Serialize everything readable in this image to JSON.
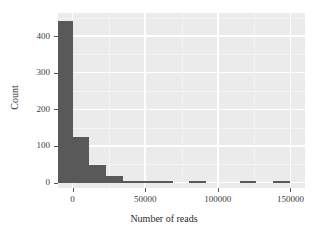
{
  "chart": {
    "title": "",
    "background": "#ffffff",
    "panel_background": "#ebebeb",
    "grid_color": "#ffffff",
    "bar_color": "#595959",
    "axis_text_color": "#3b3b3b"
  },
  "axes": {
    "x": {
      "label": "Number of reads",
      "ticks": [
        {
          "value": 0,
          "label": "0"
        },
        {
          "value": 50000,
          "label": "50000"
        },
        {
          "value": 100000,
          "label": "100000"
        },
        {
          "value": 150000,
          "label": "150000"
        }
      ],
      "minor_ticks": [
        25000,
        75000,
        125000
      ],
      "range": [
        -10000,
        160000
      ]
    },
    "y": {
      "label": "Count",
      "ticks": [
        {
          "value": 0,
          "label": "0"
        },
        {
          "value": 100,
          "label": "100"
        },
        {
          "value": 200,
          "label": "200"
        },
        {
          "value": 300,
          "label": "300"
        },
        {
          "value": 400,
          "label": "400"
        }
      ],
      "minor_ticks": [
        50,
        150,
        250,
        350,
        450
      ],
      "range": [
        -15,
        463
      ]
    }
  },
  "chart_data": {
    "type": "bar",
    "subtype": "histogram",
    "title": "",
    "xlabel": "Number of reads",
    "ylabel": "Count",
    "xlim": [
      -10000,
      160000
    ],
    "ylim": [
      -15,
      463
    ],
    "grid": true,
    "legend": null,
    "bin_width": 11500,
    "bar_color": "#595959",
    "categories": [
      "-5750",
      "5750",
      "17250",
      "28750",
      "40250",
      "51750",
      "63250",
      "74750",
      "86250",
      "97750",
      "109250",
      "120750",
      "132250",
      "143750"
    ],
    "bin_edges": [
      -11500,
      0,
      11500,
      23000,
      34500,
      46000,
      57500,
      69000,
      80500,
      92000,
      103500,
      115000,
      126500,
      138000,
      149500
    ],
    "values": [
      440,
      125,
      47,
      17,
      2,
      1,
      1,
      0,
      1,
      0,
      0,
      1,
      0,
      1
    ],
    "x_tick_labels": [
      "0",
      "50000",
      "100000",
      "150000"
    ],
    "y_tick_labels": [
      "0",
      "100",
      "200",
      "300",
      "400"
    ]
  }
}
